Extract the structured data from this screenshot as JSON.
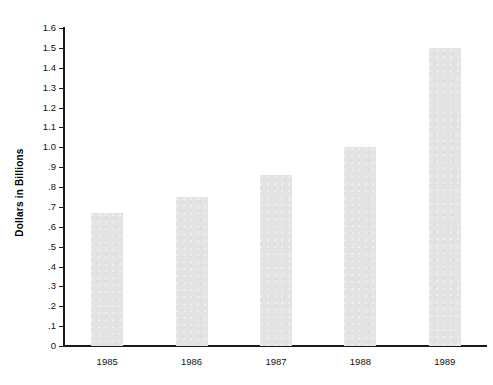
{
  "chart_data": {
    "type": "bar",
    "title": "",
    "xlabel": "",
    "ylabel": "Dollars in Billions",
    "categories": [
      "1985",
      "1986",
      "1987",
      "1988",
      "1989"
    ],
    "values": [
      0.67,
      0.75,
      0.86,
      1.0,
      1.5
    ],
    "ylim": [
      0,
      1.6
    ],
    "ytick_labels": [
      "0",
      ".1",
      ".2",
      ".3",
      ".4",
      ".5",
      ".6",
      ".7",
      ".8",
      ".9",
      "1.0",
      "1.1",
      "1.2",
      "1.3",
      "1.4",
      "1.5",
      "1.6"
    ],
    "ytick_values": [
      0,
      0.1,
      0.2,
      0.3,
      0.4,
      0.5,
      0.6,
      0.7,
      0.8,
      0.9,
      1.0,
      1.1,
      1.2,
      1.3,
      1.4,
      1.5,
      1.6
    ],
    "grid": false,
    "legend": null,
    "bar_color": "#e3e3e3",
    "axis_color": "#1a1a1a"
  }
}
